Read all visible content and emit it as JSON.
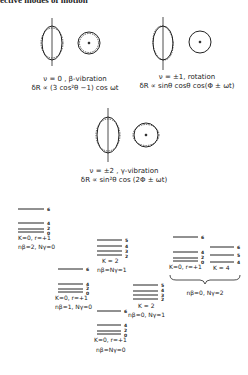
{
  "header": {
    "text": "ective modes of motion"
  },
  "modes": [
    {
      "id": "beta",
      "caption": "ν = 0 , β-vibration",
      "formula": "δR ∝ (3 cos²θ −1) cos ωt"
    },
    {
      "id": "rotation",
      "caption": "ν = ±1, rotation",
      "formula": "δR ∝ sinθ cosθ cos(Φ ± ωt)"
    },
    {
      "id": "gamma",
      "caption": "ν = ±2 , γ-vibration",
      "formula": "δR ∝ sin²θ cos (2Φ ± ωt)"
    }
  ],
  "bands": [
    {
      "id": "g1",
      "label": "K=0, r=+1",
      "sublabel": "nβ=2, Nγ=0",
      "levels": [
        "6",
        "4",
        "2",
        "0"
      ]
    },
    {
      "id": "g2",
      "label": "K=0, r=+1",
      "sublabel": "nβ=1, Nγ=0",
      "levels": [
        "6",
        "4",
        "2",
        "0"
      ]
    },
    {
      "id": "g3",
      "label": "K = 2",
      "sublabel": "nβ=Nγ=1",
      "levels": [
        "5",
        "4",
        "3",
        "2"
      ]
    },
    {
      "id": "g4",
      "label": "K=0, r=+1",
      "sublabel": "nβ=Nγ=0",
      "levels": [
        "6",
        "4",
        "2",
        "0"
      ]
    },
    {
      "id": "g5",
      "label": "K = 2",
      "sublabel": "nβ=0, Nγ=1",
      "levels": [
        "5",
        "4",
        "3",
        "2"
      ]
    },
    {
      "id": "g6",
      "label": "K=0, r=+1",
      "sublabel": "",
      "levels": [
        "6",
        "4",
        "2",
        "0"
      ]
    },
    {
      "id": "g7",
      "label": "K = 4",
      "sublabel": "",
      "levels": [
        "6",
        "5",
        "4"
      ]
    }
  ],
  "brace_label": "nβ=0, Nγ=2"
}
